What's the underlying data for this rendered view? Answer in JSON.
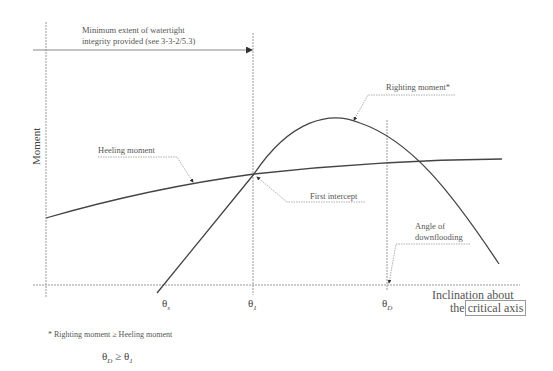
{
  "diagram": {
    "y_axis_label": "Moment",
    "x_axis_label_line1": "Inclination about",
    "x_axis_label_the": "the",
    "x_axis_label_boxed": "critical axis",
    "watertight_label_line1": "Minimum extent of watertight",
    "watertight_label_line2": "integrity provided (see 3-3-2/5.3)",
    "righting_moment_label": "Righting moment*",
    "heeling_moment_label": "Heeling moment",
    "first_intercept_label": "First intercept",
    "downflooding_label_line1": "Angle of",
    "downflooding_label_line2": "downflooding",
    "ticks": {
      "theta_s": {
        "symbol": "θ",
        "sub": "s"
      },
      "theta_1": {
        "symbol": "θ",
        "sub": "1"
      },
      "theta_d": {
        "symbol": "θ",
        "sub": "D"
      }
    },
    "footnote": "* Righting moment ≥ Heeling moment",
    "inequality": {
      "left": "θ",
      "left_sub": "D",
      "op": " ≥ ",
      "right": "θ",
      "right_sub": "1"
    },
    "colors": {
      "curve": "#444444",
      "axis": "#888888",
      "leader": "#999999"
    }
  }
}
